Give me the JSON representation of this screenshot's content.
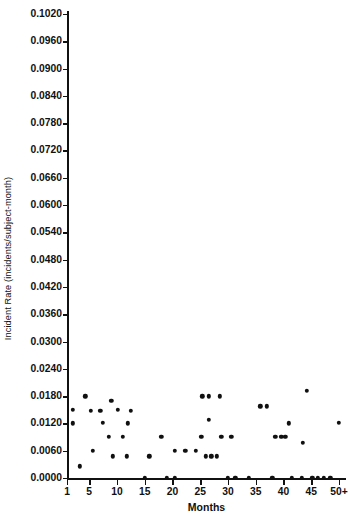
{
  "chart_data": {
    "type": "scatter",
    "title": "",
    "xlabel": "Months",
    "ylabel": "Incident Rate (incidents/subject-month)",
    "xlim": [
      0,
      52
    ],
    "ylim": [
      0.0,
      0.102
    ],
    "grid": false,
    "legend": null,
    "x_ticks": [
      {
        "label": "1",
        "value": 1
      },
      {
        "label": "5",
        "value": 5
      },
      {
        "label": "10",
        "value": 10
      },
      {
        "label": "15",
        "value": 15
      },
      {
        "label": "20",
        "value": 20
      },
      {
        "label": "25",
        "value": 25
      },
      {
        "label": "30",
        "value": 30
      },
      {
        "label": "35",
        "value": 35
      },
      {
        "label": "40",
        "value": 40
      },
      {
        "label": "45",
        "value": 45
      },
      {
        "label": "50+",
        "value": 50
      }
    ],
    "y_ticks": [
      {
        "label": "0.1020",
        "value": 0.102
      },
      {
        "label": "0.0960",
        "value": 0.096
      },
      {
        "label": "0.0900",
        "value": 0.09
      },
      {
        "label": "0.0840",
        "value": 0.084
      },
      {
        "label": "0.0780",
        "value": 0.078
      },
      {
        "label": "0.0720",
        "value": 0.072
      },
      {
        "label": "0.0660",
        "value": 0.066
      },
      {
        "label": "0.0600",
        "value": 0.06
      },
      {
        "label": "0.0540",
        "value": 0.054
      },
      {
        "label": "0.0480",
        "value": 0.048
      },
      {
        "label": "0.0420",
        "value": 0.042
      },
      {
        "label": "0.0360",
        "value": 0.036
      },
      {
        "label": "0.0300",
        "value": 0.03
      },
      {
        "label": "0.0240",
        "value": 0.024
      },
      {
        "label": "0.0180",
        "value": 0.018
      },
      {
        "label": "0.0120",
        "value": 0.012
      },
      {
        "label": "0.0060",
        "value": 0.006
      },
      {
        "label": "0.0000",
        "value": 0.0
      }
    ],
    "marker": {
      "shape": "circle",
      "color": "#101010",
      "size_px": 4.4
    },
    "points": [
      {
        "x": 2.0,
        "y": 0.015
      },
      {
        "x": 2.0,
        "y": 0.012
      },
      {
        "x": 3.3,
        "y": 0.0026
      },
      {
        "x": 4.3,
        "y": 0.018
      },
      {
        "x": 5.3,
        "y": 0.0148
      },
      {
        "x": 5.6,
        "y": 0.006
      },
      {
        "x": 7.0,
        "y": 0.0148
      },
      {
        "x": 7.4,
        "y": 0.0122
      },
      {
        "x": 10.2,
        "y": 0.015
      },
      {
        "x": 9.0,
        "y": 0.017
      },
      {
        "x": 12.5,
        "y": 0.0148
      },
      {
        "x": 12.0,
        "y": 0.012
      },
      {
        "x": 8.5,
        "y": 0.009
      },
      {
        "x": 11.0,
        "y": 0.009
      },
      {
        "x": 9.2,
        "y": 0.0048
      },
      {
        "x": 11.8,
        "y": 0.0048
      },
      {
        "x": 15.8,
        "y": 0.0048
      },
      {
        "x": 15.0,
        "y": 0.0
      },
      {
        "x": 18.0,
        "y": 0.009
      },
      {
        "x": 20.4,
        "y": 0.006
      },
      {
        "x": 22.3,
        "y": 0.006
      },
      {
        "x": 24.2,
        "y": 0.006
      },
      {
        "x": 19.0,
        "y": 0.0
      },
      {
        "x": 20.4,
        "y": 0.0
      },
      {
        "x": 25.4,
        "y": 0.018
      },
      {
        "x": 26.5,
        "y": 0.018
      },
      {
        "x": 28.5,
        "y": 0.018
      },
      {
        "x": 26.5,
        "y": 0.0128
      },
      {
        "x": 25.2,
        "y": 0.009
      },
      {
        "x": 26.0,
        "y": 0.0048
      },
      {
        "x": 27.0,
        "y": 0.0048
      },
      {
        "x": 28.0,
        "y": 0.0048
      },
      {
        "x": 28.8,
        "y": 0.009
      },
      {
        "x": 30.6,
        "y": 0.009
      },
      {
        "x": 30.0,
        "y": 0.0
      },
      {
        "x": 31.3,
        "y": 0.0
      },
      {
        "x": 35.8,
        "y": 0.0158
      },
      {
        "x": 37.0,
        "y": 0.0158
      },
      {
        "x": 33.8,
        "y": 0.0
      },
      {
        "x": 38.5,
        "y": 0.009
      },
      {
        "x": 39.6,
        "y": 0.009
      },
      {
        "x": 40.3,
        "y": 0.009
      },
      {
        "x": 44.2,
        "y": 0.0192
      },
      {
        "x": 41.0,
        "y": 0.012
      },
      {
        "x": 43.5,
        "y": 0.0078
      },
      {
        "x": 50.0,
        "y": 0.0122
      },
      {
        "x": 38.0,
        "y": 0.0
      },
      {
        "x": 41.5,
        "y": 0.0
      },
      {
        "x": 43.3,
        "y": 0.0
      },
      {
        "x": 45.2,
        "y": 0.0
      },
      {
        "x": 46.2,
        "y": 0.0
      },
      {
        "x": 47.3,
        "y": 0.0
      },
      {
        "x": 48.4,
        "y": 0.0
      }
    ]
  }
}
